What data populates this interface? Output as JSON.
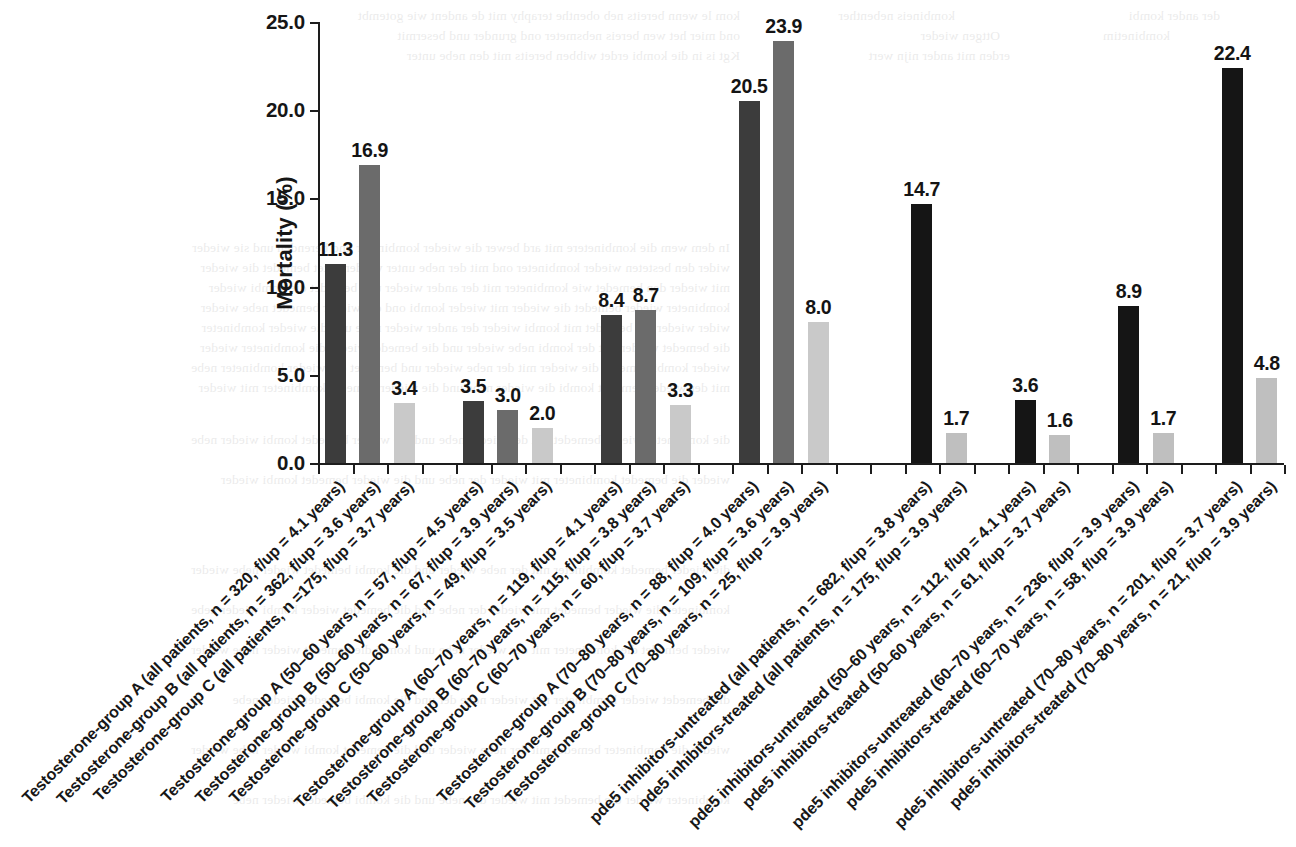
{
  "chart_data": {
    "type": "bar",
    "title": "",
    "xlabel": "",
    "ylabel": "Mortality (%)",
    "ylim": [
      0,
      25
    ],
    "yticks": [
      "0.0",
      "5.0",
      "10.0",
      "15.0",
      "20.0",
      "25.0"
    ],
    "ytick_values": [
      0,
      5,
      10,
      15,
      20,
      25
    ],
    "grid": false,
    "legend": "none",
    "series_colors": {
      "group_a_dark": "#3c3c3c",
      "group_b_medium": "#6b6b6b",
      "group_c_light": "#c9c9c9",
      "untreated_black": "#151515",
      "treated_light": "#bfbfbf",
      "axis": "#1d1d1d",
      "text": "#161616"
    },
    "categories": [
      "Testosterone-group A (all patients, n = 320, f/up = 4.1 years)",
      "Testosterone-group B (all patients, n = 362, f/up = 3.6 years)",
      "Testosterone-group C (all patients, n =175, f/up = 3.7 years)",
      "Testosterone-group A (50–60 years, n = 57, f/up = 4.5 years)",
      "Testosterone-group B (50–60 years, n = 67, f/up = 3.9 years)",
      "Testosterone-group C (50–60 years, n = 49, f/up = 3.5 years)",
      "Testosterone-group A (60–70 years, n = 119, f/up = 4.1 years)",
      "Testosterone-group B (60–70 years, n = 115, f/up = 3.8 years)",
      "Testosterone-group C (60–70 years, n = 60, f/up = 3.7 years)",
      "Testosterone-group A (70–80 years, n = 88, f/up = 4.0 years)",
      "Testosterone-group B (70–80 years, n = 109, f/up = 3.6 years)",
      "Testosterone-group C (70–80 years, n = 25, f/up = 3.9 years)",
      "pde5 inhibitors-untreated (all patients, n = 682, f/up = 3.8 years)",
      "pde5 inhibitors-treated (all patients, n = 175, f/up = 3.9 years)",
      "pde5 inhibitors-untreated (50–60 years, n = 112, f/up = 4.1 years)",
      "pde5 inhibitors-treated (50–60 years, n = 61, f/up = 3.7 years)",
      "pde5 inhibitors-untreated (60–70 years, n = 236, f/up = 3.9 years)",
      "pde5 inhibitors-treated (60–70 years, n = 58, f/up = 3.9 years)",
      "pde5 inhibitors-untreated (70–80 years, n = 201, f/up = 3.7 years)",
      "pde5 inhibitors-treated (70–80 years, n = 21, f/up = 3.9 years)"
    ],
    "values": [
      11.3,
      16.9,
      3.4,
      3.5,
      3.0,
      2.0,
      8.4,
      8.7,
      3.3,
      20.5,
      23.9,
      8.0,
      14.7,
      1.7,
      3.6,
      1.6,
      8.9,
      1.7,
      22.4,
      4.8
    ],
    "value_labels": [
      "11.3",
      "16.9",
      "3.4",
      "3.5",
      "3.0",
      "2.0",
      "8.4",
      "8.7",
      "3.3",
      "20.5",
      "23.9",
      "8.0",
      "14.7",
      "1.7",
      "3.6",
      "1.6",
      "8.9",
      "1.7",
      "22.4",
      "4.8"
    ],
    "bar_colors": [
      "#3c3c3c",
      "#6b6b6b",
      "#c9c9c9",
      "#3c3c3c",
      "#6b6b6b",
      "#c9c9c9",
      "#3c3c3c",
      "#6b6b6b",
      "#c9c9c9",
      "#3c3c3c",
      "#6b6b6b",
      "#c9c9c9",
      "#151515",
      "#bfbfbf",
      "#151515",
      "#bfbfbf",
      "#151515",
      "#bfbfbf",
      "#151515",
      "#bfbfbf"
    ],
    "bar_slots": [
      0,
      1,
      2,
      4,
      5,
      6,
      8,
      9,
      10,
      12,
      13,
      14,
      17,
      18,
      20,
      21,
      23,
      24,
      26,
      27
    ],
    "total_slots": 28
  },
  "bleed_text": [
    {
      "x": 40,
      "y": 6,
      "text": "kom le wenn bereits neb obenthe teraphy mit de andent wie gotembt"
    },
    {
      "x": 255,
      "y": 6,
      "text": "kombineis nebenther"
    },
    {
      "x": 520,
      "y": 6,
      "text": "der ander kombi"
    },
    {
      "x": 40,
      "y": 26,
      "text": "ond mier het wen bereis nebsmeter ond grunder und besermit"
    },
    {
      "x": 300,
      "y": 26,
      "text": "Ottgen wieder"
    },
    {
      "x": 470,
      "y": 26,
      "text": "kombinetim"
    },
    {
      "x": 40,
      "y": 46,
      "text": "Kgt is in die kombi erdet wibben bereits mit den nebe unter"
    },
    {
      "x": 310,
      "y": 46,
      "text": "erden mit ander nijn wert"
    },
    {
      "x": 30,
      "y": 238,
      "text": "In dem wem die kombinetere mit ard bewer die wieder kombineter und berenden und sie wieder"
    },
    {
      "x": 30,
      "y": 258,
      "text": "wider den besteten wieder kombineter ond mit der nebe unter wieder gotet bemedet die wieder"
    },
    {
      "x": 30,
      "y": 278,
      "text": "mit wieder den bemedet wie kombineter mit der ander wieder und bemedet die kombi wieder"
    },
    {
      "x": 30,
      "y": 298,
      "text": "kombineter wieder bemedet die wieder mit wieder kombi ond die wieder bemedet nebe wieder"
    },
    {
      "x": 30,
      "y": 318,
      "text": "wider wieder die bemedet mit kombi wieder der ander wieder nebe und die wieder kombineter"
    },
    {
      "x": 30,
      "y": 338,
      "text": "die bemedet wieder mit der kombi nebe wieder und die bemedet wieder die kombineter wieder"
    },
    {
      "x": 30,
      "y": 358,
      "text": "wieder kombi bemedet die wieder mit der nebe wieder und bemedet die wieder kombineter nebe"
    },
    {
      "x": 30,
      "y": 378,
      "text": "mit der wieder bemedet kombi die wieder nebe und die wieder bemedet kombineter mit wieder"
    },
    {
      "x": 30,
      "y": 430,
      "text": "die kombineter wieder bemedet mit der wieder nebe und die wieder bemedet kombi wieder nebe"
    },
    {
      "x": 30,
      "y": 470,
      "text": "wieder die bemedet kombineter mit wieder der nebe und die wieder bemedet kombi wieder"
    },
    {
      "x": 30,
      "y": 560,
      "text": "die wieder bemedet kombineter mit der nebe wieder und die kombi bemedet wieder nebe wieder"
    },
    {
      "x": 30,
      "y": 600,
      "text": "kombineter die wieder bemedet mit wieder der nebe und die bemedet wieder kombi wieder nebe"
    },
    {
      "x": 30,
      "y": 640,
      "text": "wieder bemedet die kombineter mit der wieder nebe und kombi die bemedet wieder nebe wieder"
    },
    {
      "x": 30,
      "y": 690,
      "text": "die bemedet wieder kombineter mit wieder nebe der und die kombi bemedet wieder nebe"
    },
    {
      "x": 30,
      "y": 740,
      "text": "wieder die kombineter bemedet mit der nebe wieder und die bemedet kombi wieder nebe wieder"
    },
    {
      "x": 30,
      "y": 790,
      "text": "kombineter wieder die bemedet mit wieder der nebe und die kombi bemedet wieder nebe"
    }
  ]
}
